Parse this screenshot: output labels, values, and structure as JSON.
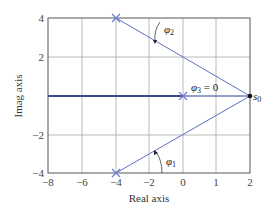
{
  "figure": {
    "xlabel": "Real axis",
    "ylabel": "Imag axis",
    "x_ticks": [
      {
        "value": -8,
        "label": "−8"
      },
      {
        "value": -6,
        "label": "−6"
      },
      {
        "value": -4,
        "label": "−4"
      },
      {
        "value": -2,
        "label": "−2"
      },
      {
        "value": 0,
        "label": "0"
      },
      {
        "value": 1,
        "label": "1"
      },
      {
        "value": 2,
        "label": "2"
      }
    ],
    "y_ticks": [
      {
        "value": 4,
        "label": "4"
      },
      {
        "value": 2,
        "label": "2"
      },
      {
        "value": -2,
        "label": "−2"
      },
      {
        "value": -4,
        "label": "−4"
      }
    ],
    "poles": [
      {
        "name": "pole-top",
        "x": -4,
        "y": 4
      },
      {
        "name": "pole-origin",
        "x": 0,
        "y": 0
      },
      {
        "name": "pole-bottom",
        "x": -4,
        "y": -4
      }
    ],
    "test_point": {
      "label": "s",
      "sub": "0",
      "x": 2,
      "y": 0
    },
    "angles": [
      {
        "symbol": "φ",
        "sub": "2",
        "text": ""
      },
      {
        "symbol": "φ",
        "sub": "3",
        "text": " = 0"
      },
      {
        "symbol": "φ",
        "sub": "1",
        "text": ""
      }
    ],
    "colors": {
      "line": "#5b6fc4",
      "grid": "#9a9a9a",
      "frame": "#555555",
      "real_axis": "#3a4a8a",
      "marker": "#6a7fd0"
    }
  }
}
